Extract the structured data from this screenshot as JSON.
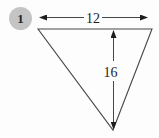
{
  "figure": {
    "problem_number": "1",
    "shape": "triangle",
    "width_label": "12",
    "height_label": "16"
  },
  "colors": {
    "background": "#fdfdfd",
    "line": "#474747",
    "arrowhead": "#1c1c1c",
    "badge_background": "#c4c4c4",
    "badge_text": "#262626",
    "label_text": "#1d1d1d"
  }
}
